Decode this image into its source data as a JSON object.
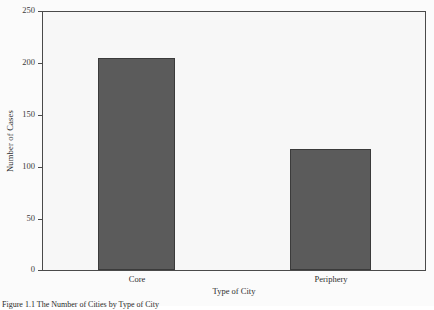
{
  "chart_data": {
    "type": "bar",
    "title": "",
    "categories": [
      "Core",
      "Periphery"
    ],
    "values": [
      205,
      117
    ],
    "xlabel": "Type of City",
    "ylabel": "Number of Cases",
    "ylim": [
      0,
      250
    ],
    "yticks": [
      0,
      50,
      100,
      150,
      200,
      250
    ],
    "ytick_labels": [
      "0",
      "50",
      "100",
      "150",
      "200",
      "250"
    ],
    "grid": false,
    "legend": "none",
    "bar_color": "#5b5b5b",
    "bar_edge_color": "#3b3b3b",
    "plot_background": "#f7f7f7",
    "frame_color": "#4a4a4a"
  },
  "caption": {
    "text": "Figure 1.1   The Number of Cities by Type of City"
  }
}
